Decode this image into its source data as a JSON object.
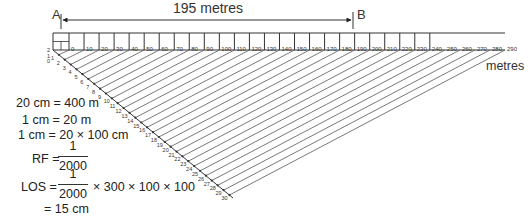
{
  "dimension": {
    "label": "195 metres",
    "start_marker": "A",
    "end_marker": "B"
  },
  "scale": {
    "unit_label": "metres",
    "main_tick_labels": [
      "0",
      "10",
      "20",
      "30",
      "40",
      "50",
      "60",
      "70",
      "80",
      "90",
      "100",
      "110",
      "120",
      "130",
      "140",
      "150",
      "160",
      "170",
      "180",
      "190",
      "200",
      "210",
      "220",
      "230",
      "240",
      "250",
      "260",
      "270",
      "280",
      "290"
    ],
    "boxed_until": "240",
    "secondary_labels": [
      "2",
      "1",
      "0"
    ],
    "diagonal_labels": [
      "1",
      "2",
      "3",
      "4",
      "5",
      "6",
      "7",
      "8",
      "9",
      "10",
      "11",
      "12",
      "13",
      "14",
      "15",
      "16",
      "17",
      "18",
      "19",
      "20",
      "21",
      "22",
      "23",
      "24",
      "25",
      "26",
      "27",
      "28",
      "29",
      "30"
    ]
  },
  "calculation": {
    "line1": "20 cm = 400 m",
    "line2": "1 cm = 20 m",
    "line3": "1 cm = 20 × 100 cm",
    "rf_label": "RF =",
    "rf_numerator": "1",
    "rf_denominator": "2000",
    "los_label": "LOS =",
    "los_numerator": "1",
    "los_denominator": "2000",
    "los_multiplier": "× 300 × 100 × 100",
    "result": "= 15 cm"
  },
  "colors": {
    "line": "#333333",
    "hatch": "#555555",
    "text": "#222222"
  }
}
